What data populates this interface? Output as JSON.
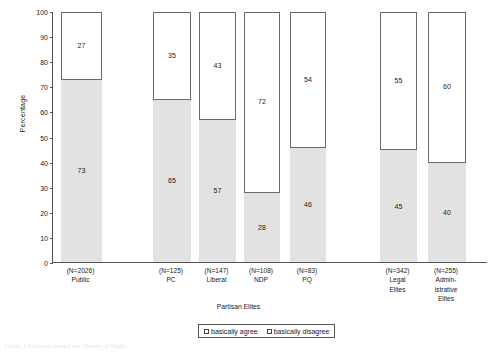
{
  "chart_data": {
    "type": "bar",
    "subtype": "stacked-100",
    "title": "",
    "xlabel": "Partisan Elites",
    "ylabel": "Percentage",
    "ylim": [
      0,
      100
    ],
    "yticks": [
      0,
      10,
      20,
      30,
      40,
      50,
      60,
      70,
      80,
      90,
      100
    ],
    "grid": false,
    "legend_position": "bottom",
    "categories": [
      "Public",
      "PC",
      "Liberal",
      "NDP",
      "PQ",
      "Legal Elites",
      "Administrative Elites"
    ],
    "category_labels": [
      {
        "n": "(N=2026)",
        "name": [
          "Public"
        ]
      },
      {
        "n": "(N=125)",
        "name": [
          "PC"
        ]
      },
      {
        "n": "(N=147)",
        "name": [
          "Liberal"
        ]
      },
      {
        "n": "(N=108)",
        "name": [
          "NDP"
        ]
      },
      {
        "n": "(N=83)",
        "name": [
          "PQ"
        ]
      },
      {
        "n": "(N=342)",
        "name": [
          "Legal",
          "Elites"
        ]
      },
      {
        "n": "(N=255)",
        "name": [
          "Admin-",
          "istrative",
          "Elites"
        ]
      }
    ],
    "series": [
      {
        "name": "basically agree",
        "color": "#e2e2e2",
        "values": [
          73,
          65,
          57,
          28,
          46,
          45,
          40
        ]
      },
      {
        "name": "basically disagree",
        "color": "#ffffff",
        "values": [
          27,
          35,
          43,
          72,
          54,
          55,
          60
        ]
      }
    ]
  },
  "axis": {
    "y_title": "Percentage",
    "x_group_title": "Partisan Elites",
    "tick_0": "0",
    "tick_10": "10",
    "tick_20": "20",
    "tick_30": "30",
    "tick_40": "40",
    "tick_50": "50",
    "tick_60": "60",
    "tick_70": "70",
    "tick_80": "80",
    "tick_90": "90",
    "tick_100": "100"
  },
  "legend": {
    "agree_label": "basically agree",
    "disagree_label": "basically disagree"
  },
  "caption": {
    "text": "Figure 1  Attitudes toward the Charter of Rights"
  }
}
